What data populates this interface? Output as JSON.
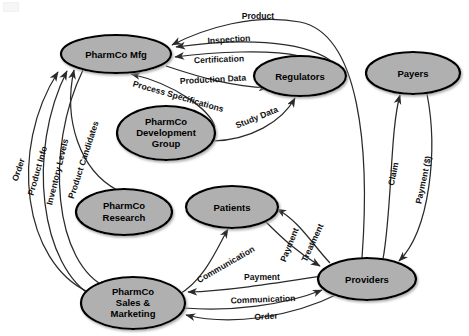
{
  "diagram": {
    "colors": {
      "node_fill": "#b0b0b0",
      "node_stroke": "#000000",
      "edge": "#2a2a2a",
      "background": "#ffffff",
      "label_text": "#111111"
    },
    "nodes": [
      {
        "id": "mfg",
        "label": "PharmCo Mfg",
        "lines": [
          "PharmCo Mfg"
        ],
        "cx": 116,
        "cy": 54,
        "rx": 55,
        "ry": 19
      },
      {
        "id": "regulators",
        "label": "Regulators",
        "lines": [
          "Regulators"
        ],
        "cx": 300,
        "cy": 76,
        "rx": 46,
        "ry": 20
      },
      {
        "id": "payers",
        "label": "Payers",
        "lines": [
          "Payers"
        ],
        "cx": 413,
        "cy": 73,
        "rx": 47,
        "ry": 21
      },
      {
        "id": "devgroup",
        "label": "PharmCo Development Group",
        "lines": [
          "PharmCo",
          "Development",
          "Group"
        ],
        "cx": 166,
        "cy": 133,
        "rx": 49,
        "ry": 27
      },
      {
        "id": "research",
        "label": "PharmCo Research",
        "lines": [
          "PharmCo",
          "Research"
        ],
        "cx": 124,
        "cy": 212,
        "rx": 48,
        "ry": 23
      },
      {
        "id": "patients",
        "label": "Patients",
        "lines": [
          "Patients"
        ],
        "cx": 232,
        "cy": 207,
        "rx": 46,
        "ry": 21
      },
      {
        "id": "providers",
        "label": "Providers",
        "lines": [
          "Providers"
        ],
        "cx": 367,
        "cy": 279,
        "rx": 49,
        "ry": 21
      },
      {
        "id": "sales",
        "label": "PharmCo Sales & Marketing",
        "lines": [
          "PharmCo",
          "Sales &",
          "Marketing"
        ],
        "cx": 133,
        "cy": 303,
        "rx": 52,
        "ry": 26
      }
    ],
    "edges": [
      {
        "id": "e-product",
        "label": "Product",
        "from": "providers",
        "to": "mfg",
        "label_x": 258,
        "label_y": 17,
        "rotate": 0
      },
      {
        "id": "e-inspection",
        "label": "Inspection",
        "from": "regulators",
        "to": "mfg",
        "label_x": 229,
        "label_y": 40,
        "rotate": -4
      },
      {
        "id": "e-certification",
        "label": "Certification",
        "from": "regulators",
        "to": "mfg",
        "label_x": 219,
        "label_y": 60,
        "rotate": -2
      },
      {
        "id": "e-production-data",
        "label": "Production Data",
        "from": "mfg",
        "to": "regulators",
        "label_x": 213,
        "label_y": 80,
        "rotate": -3
      },
      {
        "id": "e-process-specs",
        "label": "Process Specifications",
        "from": "devgroup",
        "to": "mfg",
        "label_x": 178,
        "label_y": 97,
        "rotate": 16
      },
      {
        "id": "e-study-data",
        "label": "Study Data",
        "from": "devgroup",
        "to": "regulators",
        "label_x": 257,
        "label_y": 118,
        "rotate": -22
      },
      {
        "id": "e-product-candidates",
        "label": "Product Candidates",
        "from": "research",
        "to": "mfg",
        "label_x": 84,
        "label_y": 160,
        "rotate": -72
      },
      {
        "id": "e-order-left",
        "label": "Order",
        "from": "sales",
        "to": "mfg",
        "label_x": 19,
        "label_y": 170,
        "rotate": -72
      },
      {
        "id": "e-product-info",
        "label": "Product Info",
        "from": "sales",
        "to": "mfg",
        "label_x": 38,
        "label_y": 171,
        "rotate": -74
      },
      {
        "id": "e-inventory-levels",
        "label": "Inventory Levels",
        "from": "mfg",
        "to": "sales",
        "label_x": 58,
        "label_y": 172,
        "rotate": -76
      },
      {
        "id": "e-claim",
        "label": "Claim",
        "from": "providers",
        "to": "payers",
        "label_x": 394,
        "label_y": 174,
        "rotate": -78
      },
      {
        "id": "e-payment-dollar",
        "label": "Payment ($)",
        "from": "payers",
        "to": "providers",
        "label_x": 424,
        "label_y": 180,
        "rotate": -78
      },
      {
        "id": "e-treatment",
        "label": "Treatment",
        "from": "providers",
        "to": "patients",
        "label_x": 313,
        "label_y": 243,
        "rotate": -65
      },
      {
        "id": "e-payment-patient",
        "label": "Payment",
        "from": "patients",
        "to": "providers",
        "label_x": 290,
        "label_y": 245,
        "rotate": -68
      },
      {
        "id": "e-communication-patients",
        "label": "Communication",
        "from": "sales",
        "to": "patients",
        "label_x": 226,
        "label_y": 265,
        "rotate": -30
      },
      {
        "id": "e-payment-sales",
        "label": "Payment",
        "from": "providers",
        "to": "sales",
        "label_x": 262,
        "label_y": 278,
        "rotate": 0
      },
      {
        "id": "e-communication-sales",
        "label": "Communication",
        "from": "sales",
        "to": "providers",
        "label_x": 263,
        "label_y": 300,
        "rotate": -2
      },
      {
        "id": "e-order-bottom",
        "label": "Order",
        "from": "providers",
        "to": "sales",
        "label_x": 266,
        "label_y": 317,
        "rotate": -3
      }
    ]
  }
}
